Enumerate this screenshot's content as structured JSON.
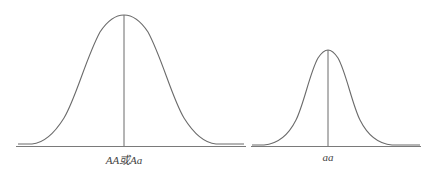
{
  "diagram": {
    "type": "two-normal-distribution-curves",
    "colors": {
      "curve": "#6b6b6b",
      "axis": "#7a7a7a",
      "label": "#444444",
      "background": "#ffffff"
    },
    "curves": [
      {
        "id": "dominant",
        "label": "AA或Aa",
        "peak_x": 124,
        "peak_y": 15,
        "left_x": 18,
        "right_x": 244,
        "relative_height": "taller, wider"
      },
      {
        "id": "recessive",
        "label": "aa",
        "peak_x": 328,
        "peak_y": 50,
        "left_x": 252,
        "right_x": 420,
        "relative_height": "shorter, narrower"
      }
    ]
  }
}
